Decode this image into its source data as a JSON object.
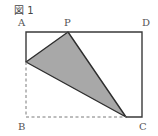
{
  "figure": {
    "caption": "図 1",
    "colors": {
      "outline": "#3a3a3a",
      "dashed": "#7a7a7a",
      "shade": "#a8a8a8",
      "label": "#555555"
    },
    "points": {
      "A": {
        "label": "A",
        "x": 26,
        "y": 32
      },
      "P": {
        "label": "P",
        "x": 68,
        "y": 32
      },
      "D": {
        "label": "D",
        "x": 142,
        "y": 32
      },
      "B": {
        "label": "B",
        "x": 26,
        "y": 117
      },
      "C": {
        "label": "C",
        "x": 142,
        "y": 117
      },
      "E": {
        "x": 26,
        "y": 62
      },
      "F": {
        "x": 126,
        "y": 117
      }
    },
    "shaded_triangle": [
      "P",
      "E",
      "F"
    ],
    "solid_outline": [
      "E",
      "A",
      "D",
      "C",
      "F"
    ],
    "dashed_lines": [
      "E",
      "B",
      "F"
    ]
  }
}
